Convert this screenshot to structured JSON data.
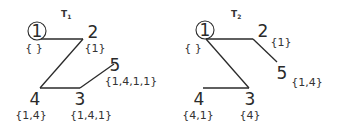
{
  "trees": [
    {
      "id": "T1",
      "title": "T",
      "title_sub": "1",
      "root": "1",
      "nodes": [
        {
          "id": "1",
          "label": "{ }",
          "circled": true
        },
        {
          "id": "2",
          "label": "{1}"
        },
        {
          "id": "3",
          "label": "{1,4,1}"
        },
        {
          "id": "4",
          "label": "{1,4}"
        },
        {
          "id": "5",
          "label": "{1,4,1,1}"
        }
      ],
      "edges": [
        [
          "1",
          "2"
        ],
        [
          "2",
          "4"
        ],
        [
          "4",
          "3"
        ],
        [
          "3",
          "5"
        ]
      ]
    },
    {
      "id": "T2",
      "title": "T",
      "title_sub": "2",
      "root": "1",
      "nodes": [
        {
          "id": "1",
          "label": "{ }",
          "circled": true
        },
        {
          "id": "2",
          "label": "{1}"
        },
        {
          "id": "3",
          "label": "{4}"
        },
        {
          "id": "4",
          "label": "{4,1}"
        },
        {
          "id": "5",
          "label": "{1,4}"
        }
      ],
      "edges": [
        [
          "1",
          "2"
        ],
        [
          "2",
          "5"
        ],
        [
          "1",
          "3"
        ],
        [
          "3",
          "4"
        ]
      ]
    }
  ]
}
